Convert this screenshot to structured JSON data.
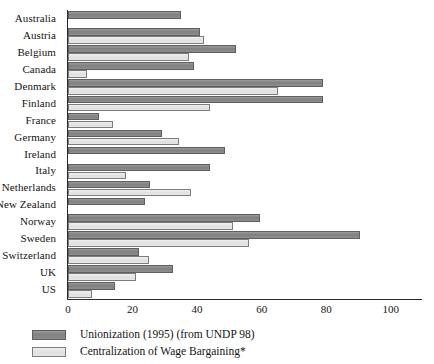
{
  "chart_data": {
    "type": "bar",
    "orientation": "horizontal",
    "title": "",
    "xlabel": "",
    "ylabel": "",
    "xlim": [
      0,
      110
    ],
    "xticks": [
      0,
      20,
      40,
      60,
      80,
      100
    ],
    "grid": false,
    "legend_position": "bottom-left",
    "categories": [
      "Australia",
      "Austria",
      "Belgium",
      "Canada",
      "Denmark",
      "Finland",
      "France",
      "Germany",
      "Ireland",
      "Italy",
      "Netherlands",
      "New Zealand",
      "Norway",
      "Sweden",
      "Switzerland",
      "UK",
      "US"
    ],
    "series": [
      {
        "name": "Unionization (1995) (from UNDP 98)",
        "color": "#8a8a8a",
        "values": [
          35,
          41,
          52,
          39,
          79,
          79,
          9.5,
          29,
          48.5,
          44,
          25.5,
          24,
          59.5,
          90.5,
          22,
          32.5,
          14.5
        ]
      },
      {
        "name": "Centralization of Wage Bargaining*",
        "color": "#e3e3e1",
        "values": [
          0,
          42,
          37.5,
          6,
          65,
          44,
          14,
          34.5,
          0,
          18,
          38,
          0,
          51,
          56,
          25,
          21,
          7.5
        ]
      }
    ]
  },
  "legend": {
    "items": [
      {
        "label": "Unionization (1995) (from UNDP 98)",
        "swatch": "dark"
      },
      {
        "label": "Centralization of Wage Bargaining*",
        "swatch": "light"
      }
    ]
  }
}
